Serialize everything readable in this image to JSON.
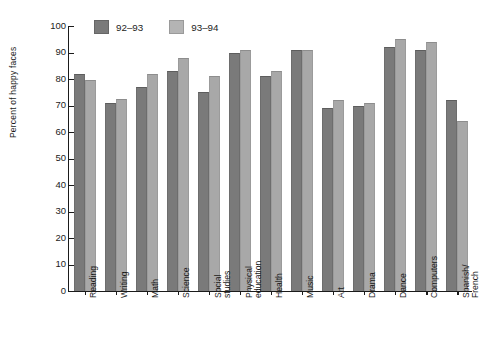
{
  "chart_data": {
    "type": "bar",
    "title": "",
    "xlabel": "",
    "ylabel": "Percent of happy faces",
    "ylim": [
      0,
      100
    ],
    "yticks": [
      0,
      10,
      20,
      30,
      40,
      50,
      60,
      70,
      80,
      90,
      100
    ],
    "grid": false,
    "legend_position": "top-center",
    "categories": [
      "Reading",
      "Writing",
      "Math",
      "Science",
      "Social studies",
      "Physical education",
      "Health",
      "Music",
      "Art",
      "Drama",
      "Dance",
      "Computers",
      "Spanish/ French"
    ],
    "category_lines": [
      [
        "Reading"
      ],
      [
        "Writing"
      ],
      [
        "Math"
      ],
      [
        "Science"
      ],
      [
        "Social",
        "studies"
      ],
      [
        "Physical",
        "education"
      ],
      [
        "Health"
      ],
      [
        "Music"
      ],
      [
        "Art"
      ],
      [
        "Drama"
      ],
      [
        "Dance"
      ],
      [
        "Computers"
      ],
      [
        "Spanish/",
        "French"
      ]
    ],
    "series": [
      {
        "name": "92–93",
        "color": "#7a7a7a",
        "values": [
          82,
          71,
          77,
          83,
          75,
          90,
          81,
          91,
          69,
          70,
          92,
          91,
          72
        ]
      },
      {
        "name": "93–94",
        "color": "#a8a8a8",
        "values": [
          79.5,
          72.5,
          82,
          88,
          81,
          91,
          83,
          91,
          72,
          71,
          95,
          94,
          64
        ]
      }
    ]
  },
  "legend": {
    "items": [
      {
        "label": "92–93"
      },
      {
        "label": "93–94"
      }
    ]
  }
}
